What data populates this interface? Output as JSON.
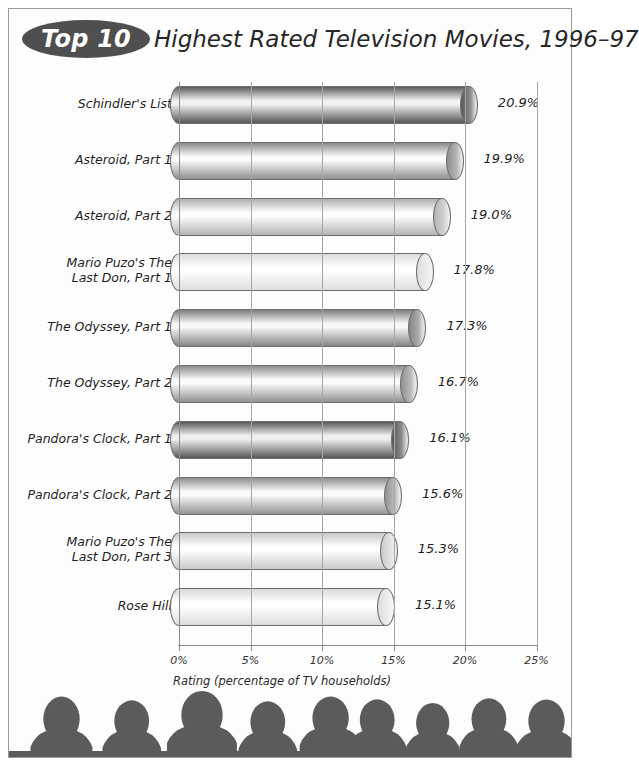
{
  "page": {
    "background": "#ffffff",
    "frame_color": "#9a9a9a"
  },
  "title": {
    "badge_label": "Top 10",
    "badge_color": "#4f4f4f",
    "badge_text_color": "#ffffff",
    "main": "Highest Rated Television Movies, 1996–97"
  },
  "chart_data": {
    "type": "bar",
    "orientation": "horizontal",
    "title": "Top 10 Highest Rated Television Movies, 1996–97",
    "subtitle": "",
    "xlabel": "Rating (percentage of TV households)",
    "ylabel": "",
    "xlim": [
      0,
      25
    ],
    "xticks": [
      0,
      5,
      10,
      15,
      20,
      25
    ],
    "xticklabels": [
      "0%",
      "5%",
      "10%",
      "15%",
      "20%",
      "25%"
    ],
    "grid": "vertical",
    "legend": "none",
    "categories": [
      "Schindler's List",
      "Asteroid, Part 1",
      "Asteroid, Part 2",
      "Mario Puzo's The Last Don, Part 1",
      "The Odyssey, Part 1",
      "The Odyssey, Part 2",
      "Pandora's Clock, Part 1",
      "Pandora's Clock, Part 2",
      "Mario Puzo's The Last Don, Part 3",
      "Rose Hill"
    ],
    "values": [
      20.9,
      19.9,
      19.0,
      17.8,
      17.3,
      16.7,
      16.1,
      15.6,
      15.3,
      15.1
    ],
    "value_labels": [
      "20.9%",
      "19.9%",
      "19.0%",
      "17.8%",
      "17.3%",
      "16.7%",
      "16.1%",
      "15.6%",
      "15.3%",
      "15.1%"
    ]
  },
  "bars": [
    {
      "label_line1": "Schindler's List",
      "label_line2": "",
      "value_label": "20.9%",
      "value": 20.9,
      "shade_top": "#5d5d5d",
      "shade_mid": "#f2f2f2",
      "shade_bottom": "#565656",
      "cap_color": "#8e8e8e"
    },
    {
      "label_line1": "Asteroid, Part 1",
      "label_line2": "",
      "value_label": "19.9%",
      "value": 19.9,
      "shade_top": "#8a8a8a",
      "shade_mid": "#fbfbfb",
      "shade_bottom": "#8f8f8f",
      "cap_color": "#b5b5b5"
    },
    {
      "label_line1": "Asteroid, Part 2",
      "label_line2": "",
      "value_label": "19.0%",
      "value": 19.0,
      "shade_top": "#b0b0b0",
      "shade_mid": "#fdfdfd",
      "shade_bottom": "#b4b4b4",
      "cap_color": "#d0d0d0"
    },
    {
      "label_line1": "Mario Puzo's The",
      "label_line2": "Last Don, Part 1",
      "value_label": "17.8%",
      "value": 17.8,
      "shade_top": "#dcdcdc",
      "shade_mid": "#ffffff",
      "shade_bottom": "#dedede",
      "cap_color": "#ececec"
    },
    {
      "label_line1": "The Odyssey, Part 1",
      "label_line2": "",
      "value_label": "17.3%",
      "value": 17.3,
      "shade_top": "#7e7e7e",
      "shade_mid": "#f8f8f8",
      "shade_bottom": "#848484",
      "cap_color": "#adadad"
    },
    {
      "label_line1": "The Odyssey, Part 2",
      "label_line2": "",
      "value_label": "16.7%",
      "value": 16.7,
      "shade_top": "#8d8d8d",
      "shade_mid": "#fafafa",
      "shade_bottom": "#919191",
      "cap_color": "#b8b8b8"
    },
    {
      "label_line1": "Pandora's Clock, Part 1",
      "label_line2": "",
      "value_label": "16.1%",
      "value": 16.1,
      "shade_top": "#5a5a5a",
      "shade_mid": "#efefef",
      "shade_bottom": "#575757",
      "cap_color": "#8b8b8b"
    },
    {
      "label_line1": "Pandora's Clock, Part 2",
      "label_line2": "",
      "value_label": "15.6%",
      "value": 15.6,
      "shade_top": "#8e8e8e",
      "shade_mid": "#fafafa",
      "shade_bottom": "#929292",
      "cap_color": "#b9b9b9"
    },
    {
      "label_line1": "Mario Puzo's The",
      "label_line2": "Last Don, Part 3",
      "value_label": "15.3%",
      "value": 15.3,
      "shade_top": "#c9c9c9",
      "shade_mid": "#fefefe",
      "shade_bottom": "#cbcbcb",
      "cap_color": "#e2e2e2"
    },
    {
      "label_line1": "Rose Hill",
      "label_line2": "",
      "value_label": "15.1%",
      "value": 15.1,
      "shade_top": "#dadada",
      "shade_mid": "#ffffff",
      "shade_bottom": "#dcdcdc",
      "cap_color": "#ededed"
    }
  ],
  "axis": {
    "ticks": [
      "0%",
      "5%",
      "10%",
      "15%",
      "20%",
      "25%"
    ],
    "caption": "Rating (percentage of TV households)"
  },
  "footer": {
    "audience_silhouette_count": 9,
    "silhouette_color": "#5b5b5b"
  }
}
